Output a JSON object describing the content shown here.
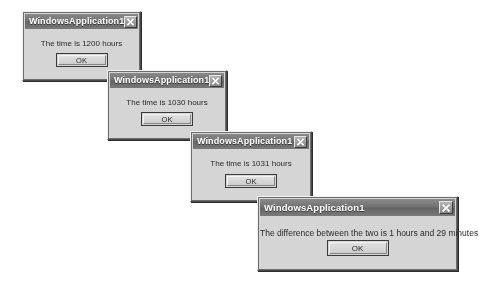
{
  "scene": {
    "description": "Four cascading Windows message boxes",
    "background_color": "#ffffff",
    "dialog_face_color": "#d6d3cb",
    "titlebar_color": "#74716c",
    "title_text_color": "#ffffff"
  },
  "dialogs": [
    {
      "title": "WindowsApplication1",
      "message": "The time is 1200 hours",
      "ok_label": "OK",
      "close_icon": "close-x-icon",
      "x": 22,
      "y": 11,
      "width": 119,
      "height": 70
    },
    {
      "title": "WindowsApplication1",
      "message": "The time is 1030 hours",
      "ok_label": "OK",
      "close_icon": "close-x-icon",
      "x": 107,
      "y": 70,
      "width": 120,
      "height": 70
    },
    {
      "title": "WindowsApplication1",
      "message": "The time is 1031 hours",
      "ok_label": "OK",
      "close_icon": "close-x-icon",
      "x": 190,
      "y": 131,
      "width": 122,
      "height": 71
    },
    {
      "title": "WindowsApplication1",
      "message": "The difference between the two is 1 hours and 29 minutes",
      "ok_label": "OK",
      "close_icon": "close-x-icon",
      "x": 257,
      "y": 196,
      "width": 201,
      "height": 75
    }
  ]
}
